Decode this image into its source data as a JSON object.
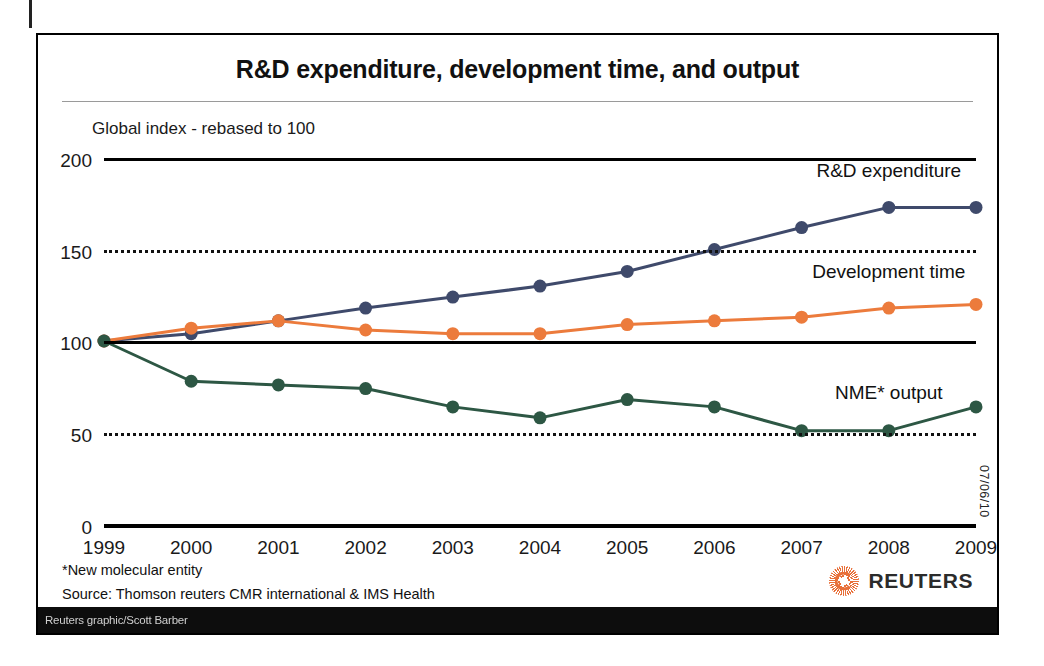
{
  "figure": {
    "title": "R&D expenditure, development time, and output",
    "subtitle": "Global index - rebased to 100",
    "footnote": "*New molecular entity",
    "source": "Source: Thomson reuters CMR international & IMS Health",
    "datestamp": "07/06/10",
    "brand": "REUTERS",
    "credit": "Reuters graphic/Scott Barber"
  },
  "chart_data": {
    "type": "line",
    "title": "R&D expenditure, development time, and output",
    "subtitle": "Global index - rebased to 100",
    "xlabel": "",
    "ylabel": "Global index - rebased to 100",
    "ylim": [
      0,
      200
    ],
    "yticks": [
      0,
      50,
      100,
      150,
      200
    ],
    "gridlines": {
      "solid": [
        200,
        100
      ],
      "dotted": [
        150,
        50
      ],
      "axis": [
        0
      ]
    },
    "legend_position": "inline-right",
    "categories": [
      1999,
      2000,
      2001,
      2002,
      2003,
      2004,
      2005,
      2006,
      2007,
      2008,
      2009
    ],
    "series": [
      {
        "name": "R&D expenditure",
        "color": "#3f4a6b",
        "values": [
          100,
          104,
          111,
          118,
          124,
          130,
          138,
          150,
          162,
          173,
          173
        ]
      },
      {
        "name": "Development time",
        "color": "#ec7b3c",
        "values": [
          100,
          107,
          111,
          106,
          104,
          104,
          109,
          111,
          113,
          118,
          120
        ]
      },
      {
        "name": "NME* output",
        "color": "#2d5744",
        "values": [
          100,
          78,
          76,
          74,
          64,
          58,
          68,
          64,
          51,
          51,
          64
        ]
      }
    ]
  }
}
